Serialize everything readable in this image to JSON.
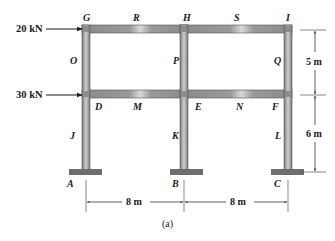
{
  "figure": {
    "caption": "(a)",
    "colors": {
      "member": "#8c8c8c",
      "member_highlight": "#d9d9d9",
      "footing": "#6e6e6e",
      "line": "#1a1a1a"
    }
  },
  "loads": [
    {
      "label": "20 kN",
      "at": "G",
      "direction": "right"
    },
    {
      "label": "30 kN",
      "at": "D",
      "direction": "right"
    }
  ],
  "nodes": {
    "G": "G",
    "R": "R",
    "H": "H",
    "S": "S",
    "I": "I",
    "O": "O",
    "P": "P",
    "Q": "Q",
    "D": "D",
    "M": "M",
    "E": "E",
    "N": "N",
    "F": "F",
    "J": "J",
    "K": "K",
    "L": "L",
    "A": "A",
    "B": "B",
    "C": "C"
  },
  "dimensions": {
    "upper_story": "5 m",
    "lower_story": "6 m",
    "bay_left": "8 m",
    "bay_right": "8 m"
  }
}
